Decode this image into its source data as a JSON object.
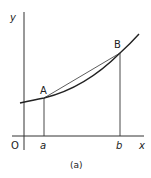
{
  "figure": {
    "caption": "(a)",
    "axes": {
      "x_label": "x",
      "y_label": "y",
      "origin_label": "O"
    },
    "points": {
      "A": {
        "label": "A",
        "x_tick": "a"
      },
      "B": {
        "label": "B",
        "x_tick": "b"
      }
    },
    "elements": [
      "curve y=f(x)",
      "chord AB",
      "vertical line from a to A",
      "vertical line from b to B"
    ],
    "colors": {
      "ink": "#222222",
      "background": "#ffffff"
    }
  }
}
